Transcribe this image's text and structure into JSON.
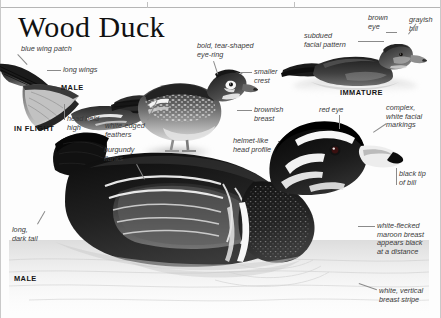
{
  "page": {
    "title": "Wood Duck",
    "background_color": "#fdfdfd",
    "rule_color": "#b5b5b5",
    "text_color": "#3a3a3a",
    "caption_color": "#141414"
  },
  "figures": [
    {
      "id": "in-flight-male",
      "caption": "IN FLIGHT",
      "sub_caption": "MALE",
      "annotations": [
        "blue wing patch",
        "long wings",
        "head held\nhigh"
      ]
    },
    {
      "id": "female-standing",
      "caption": "FEMALE",
      "annotations": [
        "bold, tear-shaped\neye-ring",
        "smaller\ncrest",
        "brownish\nbreast",
        "white-edged\nfeathers",
        "helmet-like\nhead profile"
      ]
    },
    {
      "id": "immature-swimming",
      "caption": "IMMATURE",
      "annotations": [
        "subdued\nfacial pattern",
        "brown\neye",
        "grayish\nbill"
      ]
    },
    {
      "id": "male-swimming",
      "caption": "MALE",
      "annotations": [
        "red eye",
        "complex,\nwhite facial\nmarkings",
        "black tip\nof bill",
        "white-flecked\nmaroon breast\nappears black\nat a distance",
        "white, vertical\nbreast stripe",
        "burgundy\nflanks",
        "long,\ndark tail"
      ]
    }
  ],
  "labels": {
    "blue_wing_patch": "blue wing patch",
    "long_wings": "long wings",
    "male_flight": "MALE",
    "head_held_high": "head held\nhigh",
    "in_flight": "IN FLIGHT",
    "bold_eye_ring": "bold, tear-shaped\neye-ring",
    "smaller_crest": "smaller\ncrest",
    "brownish_breast": "brownish\nbreast",
    "white_edged_feathers": "white-edged\nfeathers",
    "female": "FEMALE",
    "helmet_like": "helmet-like\nhead profile",
    "subdued_facial": "subdued\nfacial pattern",
    "brown_eye": "brown\neye",
    "grayish_bill": "grayish\nbill",
    "immature": "IMMATURE",
    "red_eye": "red eye",
    "complex_white": "complex,\nwhite facial\nmarkings",
    "black_tip": "black tip\nof bill",
    "white_flecked": "white-flecked\nmaroon breast\nappears black\nat a distance",
    "white_vertical": "white, vertical\nbreast stripe",
    "burgundy_flanks": "burgundy\nflanks",
    "long_dark_tail": "long,\ndark tail",
    "male_swim": "MALE"
  }
}
